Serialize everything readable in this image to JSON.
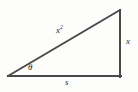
{
  "figure": {
    "type": "right-triangle-diagram",
    "background_color": "#fdfdfc",
    "stroke_color": "#4a4a4a",
    "text_color": "#2b2b2b",
    "stroke_width": 2,
    "geometry": {
      "left_vertex": {
        "x": 8,
        "y": 76
      },
      "bottom_right_vertex": {
        "x": 120,
        "y": 76
      },
      "apex_vertex": {
        "x": 120,
        "y": 10
      }
    },
    "labels": {
      "hypotenuse_base": "x",
      "hypotenuse_exponent": "2",
      "vertical_side": "x",
      "base_side": "s",
      "angle": "θ"
    }
  }
}
